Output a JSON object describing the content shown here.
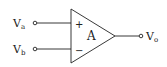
{
  "diagram": {
    "type": "op-amp",
    "inputs": [
      {
        "label": "V",
        "subscript": "a",
        "terminal": "+"
      },
      {
        "label": "V",
        "subscript": "b",
        "terminal": "−"
      }
    ],
    "amplifier": {
      "label": "A"
    },
    "output": {
      "label": "V",
      "subscript": "o"
    },
    "colors": {
      "stroke": "#222222",
      "background": "#ffffff"
    }
  }
}
